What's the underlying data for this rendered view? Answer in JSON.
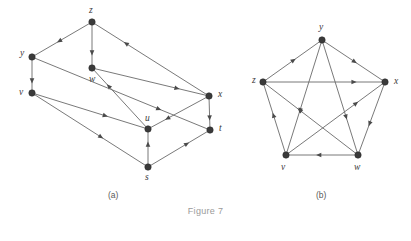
{
  "figure": {
    "caption": "Figure 7",
    "panels": [
      {
        "id": "a",
        "label": "(a)",
        "label_x": 108,
        "label_y": 198
      },
      {
        "id": "b",
        "label": "(b)",
        "label_x": 316,
        "label_y": 198
      }
    ]
  },
  "graph_a": {
    "name": "panel-a-digraph",
    "description": "Directed graph drawn as a 3D box / parallelepiped with 8 vertices",
    "nodes": [
      {
        "id": "z",
        "label": "z",
        "x": 92,
        "y": 22,
        "lx": 89,
        "ly": 13
      },
      {
        "id": "y",
        "label": "y",
        "x": 32,
        "y": 57,
        "lx": 20,
        "ly": 56
      },
      {
        "id": "w",
        "label": "w",
        "x": 92,
        "y": 68,
        "lx": 89,
        "ly": 82
      },
      {
        "id": "v",
        "label": "v",
        "x": 32,
        "y": 93,
        "lx": 19,
        "ly": 95
      },
      {
        "id": "x",
        "label": "x",
        "x": 209,
        "y": 96,
        "lx": 218,
        "ly": 97
      },
      {
        "id": "u",
        "label": "u",
        "x": 148,
        "y": 129,
        "lx": 145,
        "ly": 121
      },
      {
        "id": "t",
        "label": "t",
        "x": 210,
        "y": 130,
        "lx": 219,
        "ly": 131
      },
      {
        "id": "s",
        "label": "s",
        "x": 148,
        "y": 167,
        "lx": 145,
        "ly": 180
      }
    ],
    "edges": [
      {
        "from": "z",
        "to": "y",
        "arrow_t": 0.55
      },
      {
        "from": "z",
        "to": "w",
        "arrow_t": 0.7
      },
      {
        "from": "x",
        "to": "z",
        "arrow_t": 0.72
      },
      {
        "from": "y",
        "to": "v",
        "arrow_t": 0.7
      },
      {
        "from": "v",
        "to": "u",
        "arrow_t": 0.64
      },
      {
        "from": "v",
        "to": "s",
        "arrow_t": 0.6
      },
      {
        "from": "u",
        "to": "w",
        "arrow_t": 0.72
      },
      {
        "from": "w",
        "to": "x",
        "arrow_t": 0.74
      },
      {
        "from": "y",
        "to": "t",
        "arrow_t": 0.72
      },
      {
        "from": "x",
        "to": "u",
        "arrow_t": 0.7
      },
      {
        "from": "x",
        "to": "t",
        "arrow_t": 0.68
      },
      {
        "from": "s",
        "to": "u",
        "arrow_t": 0.62
      },
      {
        "from": "s",
        "to": "t",
        "arrow_t": 0.64
      }
    ]
  },
  "graph_b": {
    "name": "panel-b-digraph",
    "description": "Directed complete graph on five vertices drawn as a pentagon with pentagram diagonals",
    "nodes": [
      {
        "id": "y",
        "label": "y",
        "x": 322,
        "y": 40,
        "lx": 319,
        "ly": 30
      },
      {
        "id": "z",
        "label": "z",
        "x": 263,
        "y": 82,
        "lx": 252,
        "ly": 83
      },
      {
        "id": "x",
        "label": "x",
        "x": 385,
        "y": 82,
        "lx": 394,
        "ly": 84
      },
      {
        "id": "v",
        "label": "v",
        "x": 286,
        "y": 155,
        "lx": 281,
        "ly": 170
      },
      {
        "id": "w",
        "label": "w",
        "x": 358,
        "y": 155,
        "lx": 354,
        "ly": 170
      }
    ],
    "edges": [
      {
        "from": "z",
        "to": "y",
        "arrow_t": 0.52
      },
      {
        "from": "y",
        "to": "x",
        "arrow_t": 0.52
      },
      {
        "from": "x",
        "to": "w",
        "arrow_t": 0.58
      },
      {
        "from": "w",
        "to": "v",
        "arrow_t": 0.55
      },
      {
        "from": "v",
        "to": "z",
        "arrow_t": 0.55
      },
      {
        "from": "z",
        "to": "x",
        "arrow_t": 0.76
      },
      {
        "from": "y",
        "to": "v",
        "arrow_t": 0.62
      },
      {
        "from": "y",
        "to": "w",
        "arrow_t": 0.68
      },
      {
        "from": "w",
        "to": "z",
        "arrow_t": 0.62
      },
      {
        "from": "v",
        "to": "x",
        "arrow_t": 0.72
      }
    ]
  }
}
